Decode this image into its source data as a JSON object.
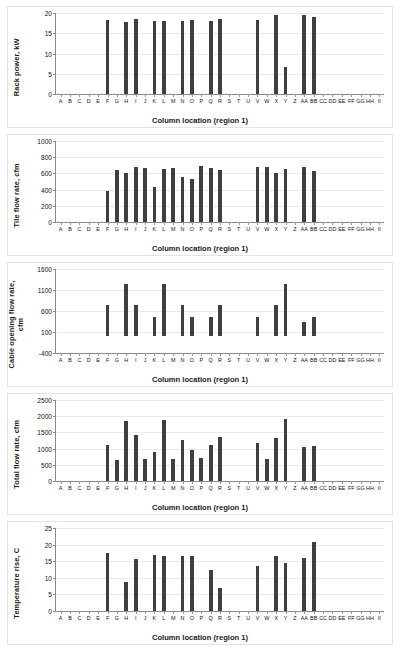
{
  "figure": {
    "background": "#ffffff",
    "bar_color": "#3f3f3f",
    "axis_color": "#8a8a8a",
    "grid_color": "#e9e9e9",
    "xlabel": "Column location (region 1)",
    "categories": [
      "A",
      "B",
      "C",
      "D",
      "E",
      "F",
      "G",
      "H",
      "I",
      "J",
      "K",
      "L",
      "M",
      "N",
      "O",
      "P",
      "Q",
      "R",
      "S",
      "T",
      "U",
      "V",
      "W",
      "X",
      "Y",
      "Z",
      "AA",
      "BB",
      "CC",
      "DD",
      "EE",
      "FF",
      "GG",
      "HH",
      "II"
    ]
  },
  "chart_data": [
    {
      "type": "bar",
      "title": "",
      "ylabel": "Rack power, kW",
      "xlabel": "Column location (region 1)",
      "ylim": [
        0,
        20
      ],
      "yticks": [
        0,
        5,
        10,
        15,
        20
      ],
      "grid": true,
      "legend": "none",
      "categories": [
        "A",
        "B",
        "C",
        "D",
        "E",
        "F",
        "G",
        "H",
        "I",
        "J",
        "K",
        "L",
        "M",
        "N",
        "O",
        "P",
        "Q",
        "R",
        "S",
        "T",
        "U",
        "V",
        "W",
        "X",
        "Y",
        "Z",
        "AA",
        "BB",
        "CC",
        "DD",
        "EE",
        "FF",
        "GG",
        "HH",
        "II"
      ],
      "values": [
        0,
        0,
        0,
        0,
        0,
        18.3,
        0,
        17.9,
        18.4,
        0,
        18.0,
        18.0,
        0,
        18.0,
        18.2,
        0,
        18.1,
        18.5,
        0,
        0,
        0,
        18.3,
        0,
        19.4,
        6.7,
        0,
        19.6,
        19.1,
        0,
        0,
        0,
        0,
        0,
        0,
        0
      ]
    },
    {
      "type": "bar",
      "title": "",
      "ylabel": "Tile flow rate, cfm",
      "xlabel": "Column location (region 1)",
      "ylim": [
        0,
        1000
      ],
      "yticks": [
        0,
        200,
        400,
        600,
        800,
        1000
      ],
      "grid": true,
      "legend": "none",
      "categories": [
        "A",
        "B",
        "C",
        "D",
        "E",
        "F",
        "G",
        "H",
        "I",
        "J",
        "K",
        "L",
        "M",
        "N",
        "O",
        "P",
        "Q",
        "R",
        "S",
        "T",
        "U",
        "V",
        "W",
        "X",
        "Y",
        "Z",
        "AA",
        "BB",
        "CC",
        "DD",
        "EE",
        "FF",
        "GG",
        "HH",
        "II"
      ],
      "values": [
        0,
        0,
        0,
        0,
        0,
        380,
        645,
        610,
        685,
        665,
        435,
        655,
        670,
        555,
        535,
        690,
        665,
        645,
        0,
        0,
        0,
        685,
        680,
        610,
        650,
        0,
        685,
        630,
        0,
        0,
        0,
        0,
        0,
        0,
        0
      ]
    },
    {
      "type": "bar",
      "title": "",
      "ylabel": "Cable opening flow rate,\ncfm",
      "xlabel": "Column location (region 1)",
      "ylim": [
        -400,
        1600
      ],
      "yticks": [
        -400,
        100,
        600,
        1100,
        1600
      ],
      "grid": true,
      "legend": "none",
      "categories": [
        "A",
        "B",
        "C",
        "D",
        "E",
        "F",
        "G",
        "H",
        "I",
        "J",
        "K",
        "L",
        "M",
        "N",
        "O",
        "P",
        "Q",
        "R",
        "S",
        "T",
        "U",
        "V",
        "W",
        "X",
        "Y",
        "Z",
        "AA",
        "BB",
        "CC",
        "DD",
        "EE",
        "FF",
        "GG",
        "HH",
        "II"
      ],
      "values": [
        0,
        0,
        0,
        0,
        0,
        740,
        0,
        1250,
        740,
        0,
        450,
        1250,
        0,
        740,
        450,
        0,
        450,
        740,
        0,
        0,
        0,
        450,
        0,
        740,
        1250,
        0,
        350,
        450,
        0,
        0,
        0,
        0,
        0,
        0,
        0
      ]
    },
    {
      "type": "bar",
      "title": "",
      "ylabel": "Total flow rate, cfm",
      "xlabel": "Column location (region 1)",
      "ylim": [
        0,
        2500
      ],
      "yticks": [
        0,
        500,
        1000,
        1500,
        2000,
        2500
      ],
      "grid": true,
      "legend": "none",
      "categories": [
        "A",
        "B",
        "C",
        "D",
        "E",
        "F",
        "G",
        "H",
        "I",
        "J",
        "K",
        "L",
        "M",
        "N",
        "O",
        "P",
        "Q",
        "R",
        "S",
        "T",
        "U",
        "V",
        "W",
        "X",
        "Y",
        "Z",
        "AA",
        "BB",
        "CC",
        "DD",
        "EE",
        "FF",
        "GG",
        "HH",
        "II"
      ],
      "values": [
        0,
        0,
        0,
        0,
        0,
        1100,
        640,
        1850,
        1410,
        670,
        890,
        1890,
        680,
        1270,
        970,
        700,
        1120,
        1360,
        0,
        0,
        0,
        1160,
        690,
        1340,
        1900,
        0,
        1060,
        1080,
        0,
        0,
        0,
        0,
        0,
        0,
        0
      ]
    },
    {
      "type": "bar",
      "title": "",
      "ylabel": "Temperature rise, C",
      "xlabel": "Column location (region 1)",
      "ylim": [
        0,
        25
      ],
      "yticks": [
        0,
        5,
        10,
        15,
        20,
        25
      ],
      "grid": true,
      "legend": "none",
      "categories": [
        "A",
        "B",
        "C",
        "D",
        "E",
        "F",
        "G",
        "H",
        "I",
        "J",
        "K",
        "L",
        "M",
        "N",
        "O",
        "P",
        "Q",
        "R",
        "S",
        "T",
        "U",
        "V",
        "W",
        "X",
        "Y",
        "Z",
        "AA",
        "BB",
        "CC",
        "DD",
        "EE",
        "FF",
        "GG",
        "HH",
        "II"
      ],
      "values": [
        0,
        0,
        0,
        0,
        0,
        17.6,
        0,
        8.6,
        15.6,
        0,
        16.9,
        16.5,
        0,
        16.7,
        16.6,
        0,
        12.2,
        7.0,
        0,
        0,
        0,
        13.5,
        0,
        16.5,
        14.5,
        0,
        16.0,
        20.7,
        0,
        0,
        0,
        0,
        0,
        0,
        0
      ]
    }
  ],
  "panels": [
    {
      "height": 122,
      "top": 6,
      "ylabel": "Rack power, kW"
    },
    {
      "height": 122,
      "top": 134,
      "ylabel": "Tile flow rate, cfm"
    },
    {
      "height": 125,
      "top": 262,
      "ylabel": "Cable opening flow rate, cfm"
    },
    {
      "height": 122,
      "top": 393,
      "ylabel": "Total flow rate, cfm"
    },
    {
      "height": 124,
      "top": 521,
      "ylabel": "Temperature rise, C"
    }
  ]
}
